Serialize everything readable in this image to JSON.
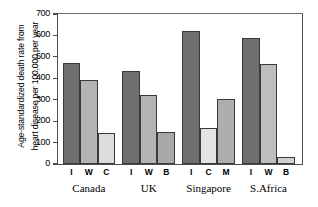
{
  "chart_data": {
    "type": "bar",
    "title": "",
    "xlabel": "",
    "ylabel_line1": "Age-standardized death rate from",
    "ylabel_line2": "heart disease per 100,000 per year",
    "ylim": [
      0,
      700
    ],
    "yticks": [
      0,
      100,
      200,
      300,
      400,
      500,
      600,
      700
    ],
    "ytick_labels": [
      "0",
      "100",
      "200",
      "300",
      "400",
      "500",
      "600",
      "700"
    ],
    "grid": false,
    "legend": "none",
    "groups": [
      {
        "name": "Canada",
        "bars": [
          {
            "label": "I",
            "value": 470,
            "color": "#6f6f6f"
          },
          {
            "label": "W",
            "value": 390,
            "color": "#b3b3b3"
          },
          {
            "label": "C",
            "value": 145,
            "color": "#dcdcdc"
          }
        ]
      },
      {
        "name": "UK",
        "bars": [
          {
            "label": "I",
            "value": 432,
            "color": "#6f6f6f"
          },
          {
            "label": "W",
            "value": 320,
            "color": "#b3b3b3"
          },
          {
            "label": "B",
            "value": 148,
            "color": "#a8a8a8"
          }
        ]
      },
      {
        "name": "Singapore",
        "bars": [
          {
            "label": "I",
            "value": 620,
            "color": "#6f6f6f"
          },
          {
            "label": "C",
            "value": 170,
            "color": "#e3e3e3"
          },
          {
            "label": "M",
            "value": 305,
            "color": "#aeaeae"
          }
        ]
      },
      {
        "name": "S.Africa",
        "bars": [
          {
            "label": "I",
            "value": 590,
            "color": "#6f6f6f"
          },
          {
            "label": "W",
            "value": 465,
            "color": "#bdbdbd"
          },
          {
            "label": "B",
            "value": 35,
            "color": "#d0d0d0"
          }
        ]
      }
    ],
    "categories": [
      "Canada I",
      "Canada W",
      "Canada C",
      "UK I",
      "UK W",
      "UK B",
      "Singapore I",
      "Singapore C",
      "Singapore M",
      "S.Africa I",
      "S.Africa W",
      "S.Africa B"
    ],
    "values": [
      470,
      390,
      145,
      432,
      320,
      148,
      620,
      170,
      305,
      590,
      465,
      35
    ]
  },
  "axis_colors": {
    "frame": "#4d4d4d",
    "bar_outline": "#3a3a3a"
  }
}
